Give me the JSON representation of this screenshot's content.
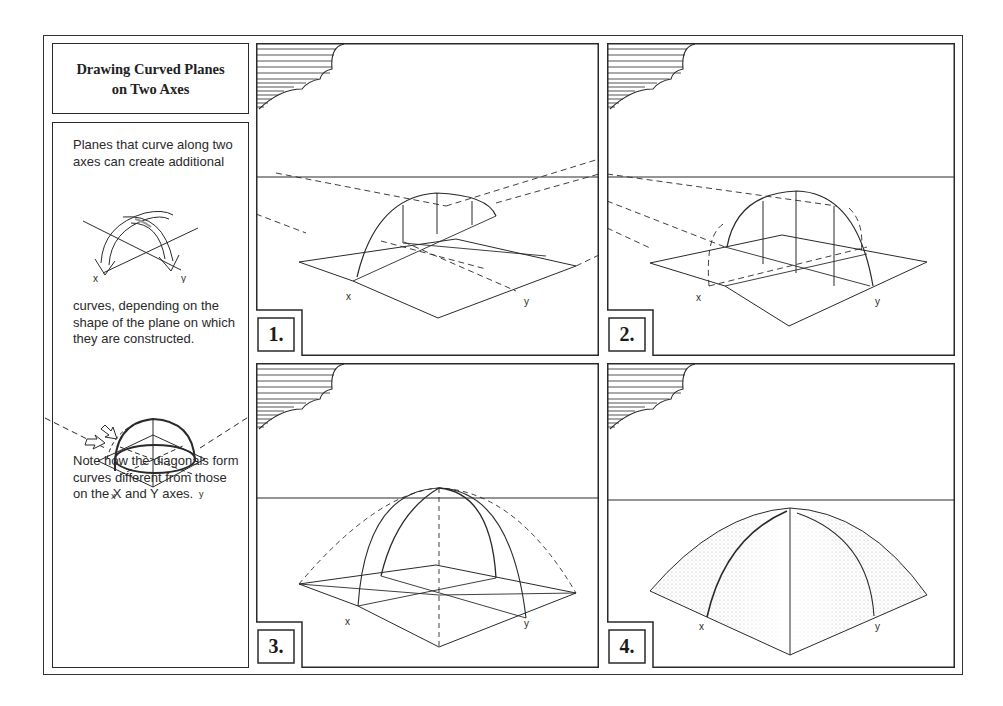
{
  "title": {
    "line1": "Drawing Curved Planes",
    "line2": "on Two Axes"
  },
  "sidebar": {
    "paragraph1": "Planes that curve along two axes can create additional",
    "paragraph2": "curves, depending on the shape of the plane on which they are constructed.",
    "paragraph3": "Note how the diagonals form curves different from those on the X and Y axes.",
    "figure1_labels": {
      "x": "x",
      "y": "y"
    },
    "figure2_labels": {
      "x": "x",
      "y": "y"
    }
  },
  "panels": [
    {
      "number": "1.",
      "axis_x": "x",
      "axis_y": "y"
    },
    {
      "number": "2.",
      "axis_x": "x",
      "axis_y": "y"
    },
    {
      "number": "3.",
      "axis_x": "x",
      "axis_y": "y"
    },
    {
      "number": "4.",
      "axis_x": "x",
      "axis_y": "y"
    }
  ],
  "colors": {
    "ink": "#2a2a2a",
    "paper": "#ffffff",
    "stipple": "#9a9a9a"
  }
}
